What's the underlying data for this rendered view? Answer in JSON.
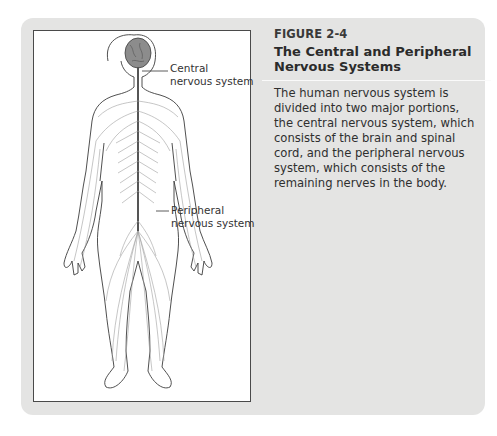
{
  "figure": {
    "number": "FIGURE 2-4",
    "title": "The Central and Peripheral Nervous Systems",
    "caption": "The human nervous system is divided into two major portions, the central nervous system, which consists of the brain and spinal cord, and the peripheral nervous system, which consists of the remaining nerves in the body.",
    "illustration": "human-nervous-system-diagram",
    "labels": {
      "central": [
        "Central",
        "nervous system"
      ],
      "peripheral": [
        "Peripheral",
        "nervous system"
      ]
    }
  },
  "colors": {
    "panel": "#e4e4e3",
    "figure_background": "#ffffff",
    "text": "#2e2e2e",
    "outline": "#4a4a4a",
    "nerves": "#9a9a9a",
    "brain": "#8a8a8a"
  }
}
